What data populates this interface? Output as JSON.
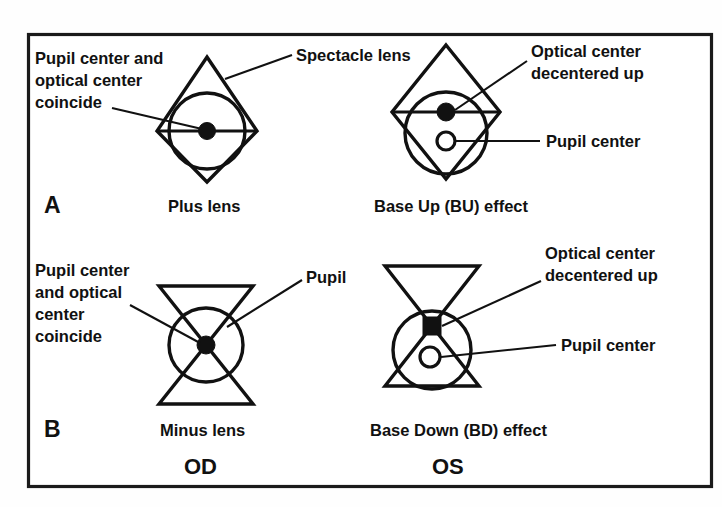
{
  "figure": {
    "border_color": "#1a1a1a",
    "ink_color": "#111111",
    "background_color": "#ffffff"
  },
  "panels": [
    {
      "letter": "A",
      "lens_type": "plus",
      "diagrams": [
        {
          "id": "plus-centered",
          "caption": "Plus lens",
          "callouts": [
            {
              "id": "pupil-optical-coincide",
              "lines": [
                "Pupil center and",
                "optical center",
                "coincide"
              ]
            },
            {
              "id": "spectacle-lens",
              "lines": [
                "Spectacle lens"
              ]
            }
          ],
          "optical_center_marker": "filled-dot",
          "pupil_center_marker": "none"
        },
        {
          "id": "plus-decentered",
          "caption": "Base Up (BU) effect",
          "callouts": [
            {
              "id": "optical-center-decentered",
              "lines": [
                "Optical center",
                "decentered up"
              ]
            },
            {
              "id": "pupil-center",
              "lines": [
                "Pupil center"
              ]
            }
          ],
          "optical_center_marker": "filled-dot",
          "pupil_center_marker": "open-ring"
        }
      ]
    },
    {
      "letter": "B",
      "lens_type": "minus",
      "diagrams": [
        {
          "id": "minus-centered",
          "caption": "Minus lens",
          "callouts": [
            {
              "id": "pupil-optical-coincide",
              "lines": [
                "Pupil center",
                "and optical",
                "center",
                "coincide"
              ]
            },
            {
              "id": "pupil",
              "lines": [
                "Pupil"
              ]
            }
          ],
          "optical_center_marker": "filled-dot",
          "pupil_center_marker": "none"
        },
        {
          "id": "minus-decentered",
          "caption": "Base Down (BD) effect",
          "callouts": [
            {
              "id": "optical-center-decentered",
              "lines": [
                "Optical center",
                "decentered up"
              ]
            },
            {
              "id": "pupil-center",
              "lines": [
                "Pupil center"
              ]
            }
          ],
          "optical_center_marker": "filled-square",
          "pupil_center_marker": "open-ring"
        }
      ]
    }
  ],
  "labels": {
    "panel_a_letter": "A",
    "panel_b_letter": "B",
    "plus_lens_caption": "Plus lens",
    "base_up_caption": "Base Up (BU) effect",
    "minus_lens_caption": "Minus lens",
    "base_down_caption": "Base Down (BD) effect",
    "od_label": "OD",
    "os_label": "OS",
    "spectacle_lens": "Spectacle lens",
    "pupil": "Pupil",
    "pupil_center": "Pupil center",
    "coincide_a_line1": "Pupil center and",
    "coincide_a_line2": "optical center",
    "coincide_a_line3": "coincide",
    "coincide_b_line1": "Pupil center",
    "coincide_b_line2": "and optical",
    "coincide_b_line3": "center",
    "coincide_b_line4": "coincide",
    "optical_center_line1": "Optical center",
    "optical_center_line2": "decentered up",
    "optical_center_bd_line1": "Optical center",
    "optical_center_bd_line2": "decentered up",
    "pupil_center_bd": "Pupil center"
  }
}
